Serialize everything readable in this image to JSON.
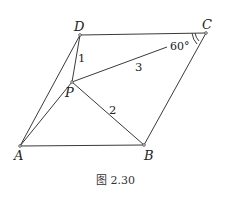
{
  "figure": {
    "caption": "图 2.30",
    "points": {
      "A": {
        "label": "A",
        "x": 20,
        "y": 146
      },
      "B": {
        "label": "B",
        "x": 144,
        "y": 145
      },
      "C": {
        "label": "C",
        "x": 206,
        "y": 33
      },
      "D": {
        "label": "D",
        "x": 80,
        "y": 35
      },
      "P": {
        "label": "P",
        "x": 72,
        "y": 82
      }
    },
    "segments": [
      {
        "from": "A",
        "to": "B"
      },
      {
        "from": "B",
        "to": "C"
      },
      {
        "from": "C",
        "to": "D"
      },
      {
        "from": "D",
        "to": "A"
      },
      {
        "from": "P",
        "to": "A"
      },
      {
        "from": "P",
        "to": "B"
      },
      {
        "from": "P",
        "to": "C"
      },
      {
        "from": "P",
        "to": "D"
      }
    ],
    "lengths": {
      "PD": "1",
      "PB": "2",
      "PC": "3"
    },
    "angle": {
      "vertex": "C",
      "value": "60°"
    }
  }
}
